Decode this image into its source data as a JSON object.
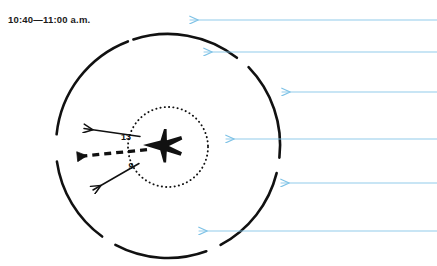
{
  "figure": {
    "title": "10:40—11:00 a.m.",
    "caption_text": "10:40—11:00 a.m.",
    "aircraft_icon": "jet-aircraft-icon",
    "colors": {
      "ink": "#111111",
      "wind_arrow_blue": "#7ec2e6",
      "background": "#ffffff"
    }
  },
  "outer_circle": {
    "name": "outer-broken-circle",
    "center_x": 168,
    "center_y": 146,
    "radius": 112,
    "stroke_width": 2.6,
    "arcs_deg": [
      {
        "name": "arc-top",
        "start": -108,
        "end": -52
      },
      {
        "name": "arc-upper-right",
        "start": -44,
        "end": 6
      },
      {
        "name": "arc-lower-right",
        "start": 14,
        "end": 62
      },
      {
        "name": "arc-bottom",
        "start": 70,
        "end": 118
      },
      {
        "name": "arc-lower-left",
        "start": 126,
        "end": 172
      },
      {
        "name": "arc-upper-left",
        "start": 186,
        "end": 249
      }
    ]
  },
  "inner_circle": {
    "name": "inner-dotted-circle",
    "center_x": 168,
    "center_y": 147,
    "radius": 40,
    "style": "dotted"
  },
  "aircraft": {
    "name": "jet-aircraft-icon",
    "x": 162,
    "y": 145,
    "heading": "west",
    "fill": "#111111"
  },
  "vectors": [
    {
      "name": "vector-arrow-13",
      "label": "13",
      "label_x": 127,
      "label_y": 137,
      "style": "solid",
      "from_x": 140,
      "from_y": 136,
      "to_x": 82,
      "to_y": 128,
      "stroke_width": 1.4
    },
    {
      "name": "vector-arrow-resultant",
      "label": "",
      "style": "dashed",
      "from_x": 146,
      "from_y": 150,
      "to_x": 74,
      "to_y": 157,
      "stroke_width": 3.2
    },
    {
      "name": "vector-arrow-9",
      "label": "9",
      "label_x": 131,
      "label_y": 166,
      "style": "solid",
      "from_x": 139,
      "from_y": 163,
      "to_x": 90,
      "to_y": 192,
      "stroke_width": 1.4
    }
  ],
  "wind_arrows": {
    "name": "wind-flow-arrows",
    "color": "#7ec2e6",
    "direction": "right-to-left",
    "count": 6,
    "items": [
      {
        "name": "wind-arrow-1",
        "y": 20,
        "tip_x": 183,
        "tail_x": 437
      },
      {
        "name": "wind-arrow-2",
        "y": 52,
        "tip_x": 197,
        "tail_x": 437
      },
      {
        "name": "wind-arrow-3",
        "y": 92,
        "tip_x": 275,
        "tail_x": 437
      },
      {
        "name": "wind-arrow-4",
        "y": 139,
        "tip_x": 219,
        "tail_x": 437
      },
      {
        "name": "wind-arrow-5",
        "y": 183,
        "tip_x": 274,
        "tail_x": 437
      },
      {
        "name": "wind-arrow-6",
        "y": 231,
        "tip_x": 192,
        "tail_x": 437
      }
    ]
  }
}
